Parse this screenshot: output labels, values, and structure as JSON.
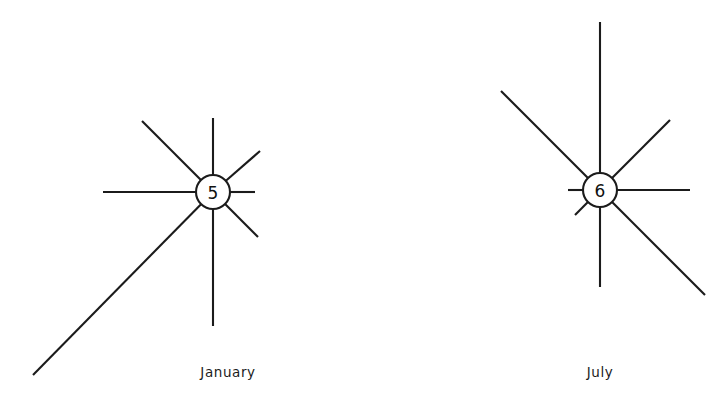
{
  "figure": {
    "type": "wind-rose",
    "background_color": "#ffffff",
    "line_color": "#1b1b1b",
    "width": 726,
    "height": 404
  },
  "chart_data": {
    "type": "scatter",
    "chart_kind": "wind-rose / star-diagram pair",
    "title": "",
    "subtitle": "",
    "xlabel": "",
    "ylabel": "",
    "grid": false,
    "legend": false,
    "axis_ticks": [],
    "panels": [
      {
        "caption": "January",
        "hub_value": "5",
        "center": {
          "x": 213,
          "y": 192
        },
        "hub_radius": 17,
        "caption_position": {
          "x": 228,
          "y": 364
        },
        "rays": [
          {
            "direction": "N",
            "angle_deg": 90,
            "length_px": 74,
            "end": {
              "x": 213,
              "y": 118
            }
          },
          {
            "direction": "NE",
            "angle_deg": 45,
            "length_px": 58,
            "end": {
              "x": 260,
              "y": 151
            }
          },
          {
            "direction": "E",
            "angle_deg": 0,
            "length_px": 42,
            "end": {
              "x": 255,
              "y": 192
            }
          },
          {
            "direction": "SE",
            "angle_deg": -45,
            "length_px": 63,
            "end": {
              "x": 258,
              "y": 237
            }
          },
          {
            "direction": "S",
            "angle_deg": -90,
            "length_px": 134,
            "end": {
              "x": 213,
              "y": 326
            }
          },
          {
            "direction": "SW",
            "angle_deg": -135,
            "length_px": 256,
            "end": {
              "x": 33,
              "y": 375
            }
          },
          {
            "direction": "W",
            "angle_deg": 180,
            "length_px": 110,
            "end": {
              "x": 103,
              "y": 192
            }
          },
          {
            "direction": "NW",
            "angle_deg": 135,
            "length_px": 100,
            "end": {
              "x": 142,
              "y": 121
            }
          }
        ]
      },
      {
        "caption": "July",
        "hub_value": "6",
        "center": {
          "x": 600,
          "y": 190
        },
        "hub_radius": 17,
        "caption_position": {
          "x": 600,
          "y": 364
        },
        "rays": [
          {
            "direction": "N",
            "angle_deg": 90,
            "length_px": 168,
            "end": {
              "x": 600,
              "y": 22
            }
          },
          {
            "direction": "NE",
            "angle_deg": 45,
            "length_px": 99,
            "end": {
              "x": 670,
              "y": 120
            }
          },
          {
            "direction": "E",
            "angle_deg": 0,
            "length_px": 90,
            "end": {
              "x": 690,
              "y": 190
            }
          },
          {
            "direction": "SE",
            "angle_deg": -45,
            "length_px": 148,
            "end": {
              "x": 705,
              "y": 295
            }
          },
          {
            "direction": "S",
            "angle_deg": -90,
            "length_px": 97,
            "end": {
              "x": 600,
              "y": 287
            }
          },
          {
            "direction": "SW",
            "angle_deg": -135,
            "length_px": 36,
            "end": {
              "x": 575,
              "y": 215
            }
          },
          {
            "direction": "W",
            "angle_deg": 180,
            "length_px": 32,
            "end": {
              "x": 568,
              "y": 190
            }
          },
          {
            "direction": "NW",
            "angle_deg": 135,
            "length_px": 140,
            "end": {
              "x": 501,
              "y": 91
            }
          }
        ]
      }
    ]
  },
  "captions": {
    "january": "January",
    "july": "July"
  },
  "hubs": {
    "january": "5",
    "july": "6"
  }
}
